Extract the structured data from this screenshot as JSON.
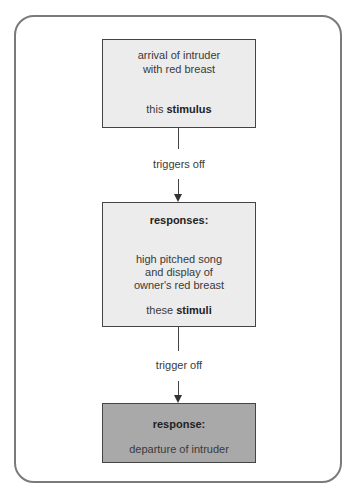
{
  "diagram": {
    "boxes": [
      {
        "id": "stimulus",
        "lines": [
          "arrival of intruder",
          "with red breast"
        ],
        "footer_prefix": "this ",
        "footer_bold": "stimulus",
        "fill": "#ececec"
      },
      {
        "id": "responses",
        "heading": "responses:",
        "lines": [
          "high pitched song",
          "and display of",
          "owner's red breast"
        ],
        "footer_prefix": "these ",
        "footer_bold": "stimuli",
        "fill": "#ececec"
      },
      {
        "id": "response",
        "heading": "response:",
        "lines": [
          "departure of intruder"
        ],
        "fill": "#a9a9a9"
      }
    ],
    "connectors": [
      {
        "from": "stimulus",
        "to": "responses",
        "label": "triggers off"
      },
      {
        "from": "responses",
        "to": "response",
        "label": "trigger off"
      }
    ]
  }
}
